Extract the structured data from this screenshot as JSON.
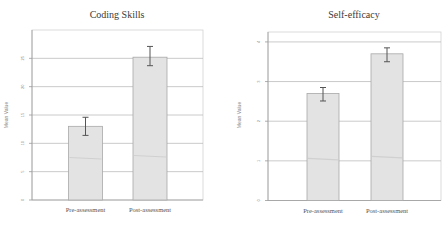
{
  "chart_data": [
    {
      "type": "bar",
      "title": "Coding Skills",
      "xlabel": "",
      "ylabel": "Mean Value",
      "categories": [
        "Pre-assessment",
        "Post-assessment"
      ],
      "values": [
        13.0,
        25.2
      ],
      "error_low": [
        11.4,
        23.7
      ],
      "error_high": [
        14.6,
        27.1
      ],
      "ylim": [
        0,
        30
      ],
      "yticks": [
        0,
        5,
        10,
        15,
        20,
        25
      ],
      "ytick_labels": [
        "0",
        "5",
        "10",
        "15",
        "20",
        "25"
      ],
      "grid": true,
      "legend": "none"
    },
    {
      "type": "bar",
      "title": "Self-efficacy",
      "xlabel": "",
      "ylabel": "Mean Value",
      "categories": [
        "Pre-assessment",
        "Post-assessment"
      ],
      "values": [
        2.7,
        3.7
      ],
      "error_low": [
        2.51,
        3.5
      ],
      "error_high": [
        2.85,
        3.85
      ],
      "ylim": [
        0,
        4.25
      ],
      "yticks": [
        0,
        1,
        2,
        3,
        4
      ],
      "ytick_labels": [
        "0",
        "1",
        "2",
        "3",
        "4"
      ],
      "grid": true,
      "legend": "none"
    }
  ]
}
